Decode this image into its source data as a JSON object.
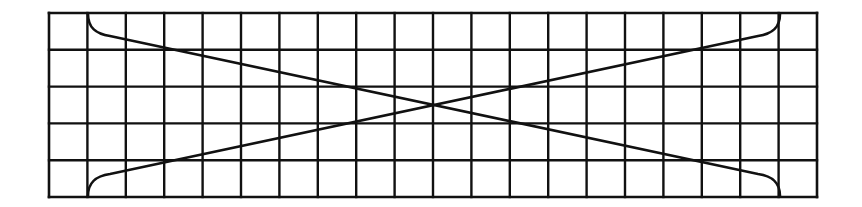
{
  "diagram": {
    "type": "grid-with-crossing-curves",
    "grid": {
      "left": 49,
      "top": 13,
      "right": 817,
      "bottom": 197,
      "columns": 20,
      "rows": 5,
      "line_color": "#111111",
      "line_width": 2.4,
      "border_width": 2.6
    },
    "curves": [
      {
        "name": "falling-curve",
        "start": [
          88,
          14
        ],
        "end": [
          780,
          196
        ],
        "description": "Starts at top of column 2, bends down sharply, runs straight diagonally through center, bends down into bottom of column 19"
      },
      {
        "name": "rising-curve",
        "start": [
          88,
          196
        ],
        "end": [
          780,
          14
        ],
        "description": "Starts at bottom of column 2, bends up sharply, runs straight diagonally through center, bends up into top of column 19"
      }
    ],
    "crossing_point": [
      433,
      105
    ],
    "curve_color": "#111111",
    "curve_width": 2.6
  }
}
